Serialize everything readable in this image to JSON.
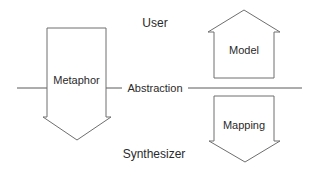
{
  "diagram": {
    "type": "conceptual-arrows",
    "labels": {
      "top": "User",
      "bottom": "Synthesizer",
      "divider": "Abstraction"
    },
    "arrows": [
      {
        "id": "metaphor",
        "label": "Metaphor",
        "direction": "down",
        "side": "left",
        "crosses_divider": true
      },
      {
        "id": "model",
        "label": "Model",
        "direction": "up",
        "side": "right",
        "position": "above-divider"
      },
      {
        "id": "mapping",
        "label": "Mapping",
        "direction": "down",
        "side": "right",
        "position": "below-divider"
      }
    ],
    "colors": {
      "stroke": "#6e6e6e",
      "text": "#2a2a2a",
      "background": "#ffffff"
    }
  }
}
